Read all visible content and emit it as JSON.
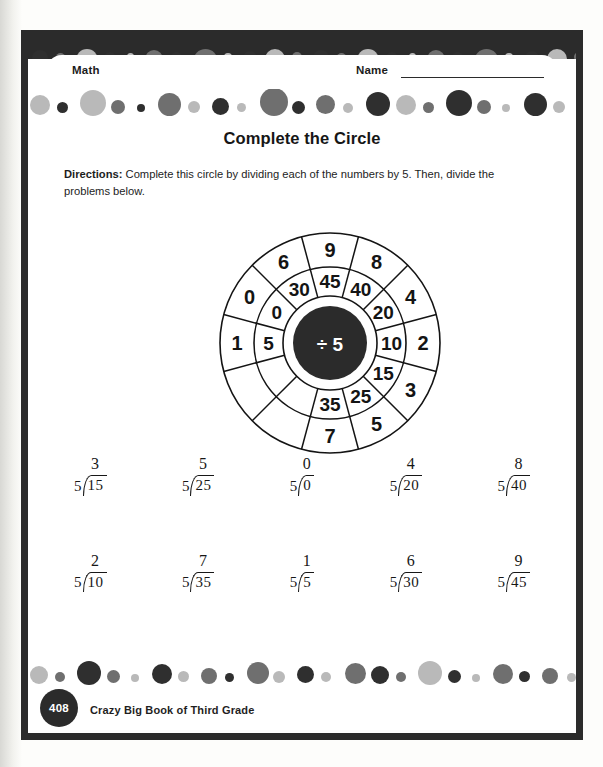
{
  "header": {
    "subject_label": "Math",
    "name_label": "Name",
    "name_value": ""
  },
  "worksheet": {
    "title": "Complete the Circle",
    "directions_label": "Directions:",
    "directions_text": " Complete this circle by dividing each of the numbers by 5. Then, divide the problems below."
  },
  "wheel": {
    "hub_label": "÷ 5",
    "sectors": [
      {
        "middle": "5",
        "outer": "1"
      },
      {
        "middle": "0",
        "outer": "0"
      },
      {
        "middle": "30",
        "outer": "6"
      },
      {
        "middle": "45",
        "outer": "9"
      },
      {
        "middle": "40",
        "outer": "8"
      },
      {
        "middle": "20",
        "outer": "4"
      },
      {
        "middle": "10",
        "outer": "2"
      },
      {
        "middle": "15",
        "outer": "3"
      },
      {
        "middle": "25",
        "outer": "5"
      },
      {
        "middle": "35",
        "outer": "7"
      }
    ]
  },
  "problems": {
    "rows": [
      [
        {
          "divisor": "5",
          "dividend": "15",
          "quotient": "3"
        },
        {
          "divisor": "5",
          "dividend": "25",
          "quotient": "5"
        },
        {
          "divisor": "5",
          "dividend": "0",
          "quotient": "0"
        },
        {
          "divisor": "5",
          "dividend": "20",
          "quotient": "4"
        },
        {
          "divisor": "5",
          "dividend": "40",
          "quotient": "8"
        }
      ],
      [
        {
          "divisor": "5",
          "dividend": "10",
          "quotient": "2"
        },
        {
          "divisor": "5",
          "dividend": "35",
          "quotient": "7"
        },
        {
          "divisor": "5",
          "dividend": "5",
          "quotient": "1"
        },
        {
          "divisor": "5",
          "dividend": "30",
          "quotient": "6"
        },
        {
          "divisor": "5",
          "dividend": "45",
          "quotient": "9"
        }
      ]
    ]
  },
  "footer": {
    "page_number": "408",
    "book_title": "Crazy Big Book of Third Grade"
  },
  "colors": {
    "ink": "#2b2b2b",
    "dot_dark": "#2f2f2f",
    "dot_mid": "#6f6f6f",
    "dot_light": "#b9b9b9"
  }
}
